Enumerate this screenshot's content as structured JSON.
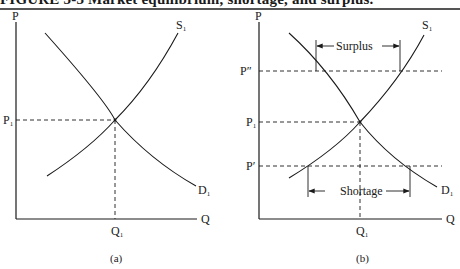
{
  "figure": {
    "title": "FIGURE 3-3 Market equilibrium, shortage, and surplus."
  },
  "panels": [
    {
      "id": "a",
      "caption": "(a)",
      "y_axis_label": "P",
      "x_axis_label": "Q",
      "supply_label": "S",
      "supply_sub": "1",
      "demand_label": "D",
      "demand_sub": "1",
      "price_labels": [
        {
          "text": "P",
          "sub": "1"
        }
      ],
      "quantity_labels": [
        {
          "text": "Q",
          "sub": "1"
        }
      ]
    },
    {
      "id": "b",
      "caption": "(b)",
      "y_axis_label": "P",
      "x_axis_label": "Q",
      "supply_label": "S",
      "supply_sub": "1",
      "demand_label": "D",
      "demand_sub": "1",
      "price_labels": [
        {
          "text": "P″",
          "sub": ""
        },
        {
          "text": "P",
          "sub": "1"
        },
        {
          "text": "P′",
          "sub": ""
        }
      ],
      "quantity_labels": [
        {
          "text": "Q",
          "sub": "1"
        }
      ],
      "surplus_label": "Surplus",
      "shortage_label": "Shortage"
    }
  ],
  "colors": {
    "ink": "#1a1a1a",
    "rule": "#555555",
    "background": "#ffffff"
  }
}
